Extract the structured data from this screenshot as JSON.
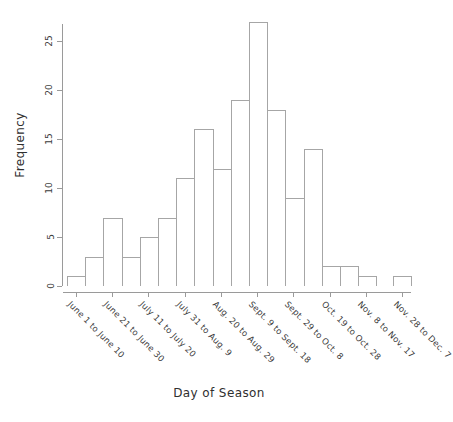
{
  "chart_data": {
    "type": "bar",
    "title": "",
    "xlabel": "Day of Season",
    "ylabel": "Frequency",
    "ylim": [
      0,
      27
    ],
    "yticks": [
      0,
      5,
      10,
      15,
      20,
      25
    ],
    "grid": false,
    "legend": null,
    "categories": [
      "June 1 to June 10",
      "June 11 to June 20",
      "June 21 to June 30",
      "July 1 to July 10",
      "July 11 to July 20",
      "July 21 to July 30",
      "July 31 to Aug. 9",
      "Aug. 10 to Aug. 19",
      "Aug. 20 to Aug. 29",
      "Aug. 30 to Sept. 8",
      "Sept. 9 to Sept. 18",
      "Sept. 19 to Sept. 28",
      "Sept. 29 to Oct. 8",
      "Oct. 9 to Oct. 18",
      "Oct. 19 to Oct. 28",
      "Oct. 29 to Nov. 7",
      "Nov. 8 to Nov. 17",
      "Nov. 18 to Nov. 27",
      "Nov. 28 to Dec. 7"
    ],
    "values": [
      1,
      3,
      7,
      3,
      5,
      7,
      11,
      16,
      12,
      19,
      27,
      18,
      9,
      14,
      2,
      2,
      1,
      0,
      1
    ],
    "xtick_labels": [
      "June 1 to June 10",
      "June 21 to June 30",
      "July 11 to July 20",
      "July 31 to Aug. 9",
      "Aug. 20 to Aug. 29",
      "Sept. 9 to Sept. 18",
      "Sept. 29 to Oct. 8",
      "Oct. 19 to Oct. 28",
      "Nov. 8 to Nov. 17",
      "Nov. 28 to Dec. 7"
    ],
    "bar_color": "#ffffff",
    "bar_edge_color": "#a6a6a6",
    "axis_color": "#9a9a9a"
  }
}
